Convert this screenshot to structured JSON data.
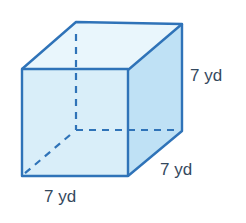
{
  "diagram": {
    "type": "cube",
    "labels": {
      "height": "7 yd",
      "depth": "7 yd",
      "width": "7 yd"
    },
    "colors": {
      "edge": "#2f73b8",
      "front_face": "#d9eef9",
      "side_face": "#bfe1f5",
      "top_face": "#e9f6fc",
      "label_text": "#34495e"
    }
  }
}
